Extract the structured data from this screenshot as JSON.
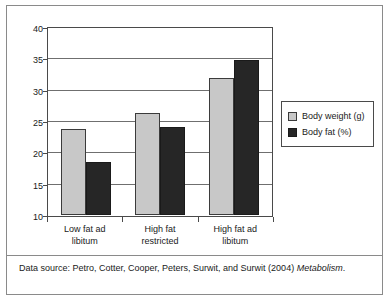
{
  "chart_data": {
    "type": "bar",
    "title": "",
    "subtitle": "",
    "xlabel": "",
    "ylabel": "",
    "categories": [
      "Low fat ad libitum",
      "High fat restricted",
      "High fat ad libitum"
    ],
    "category_lines": [
      [
        "Low fat ad",
        "libitum"
      ],
      [
        "High fat",
        "restricted"
      ],
      [
        "High fat ad",
        "libitum"
      ]
    ],
    "series": [
      {
        "name": "Body weight (g)",
        "values": [
          23.8,
          26.3,
          31.9
        ],
        "color": "#c8c8c8"
      },
      {
        "name": "Body fat (%)",
        "values": [
          18.5,
          24.1,
          34.8
        ],
        "color": "#262626"
      }
    ],
    "ylim": [
      10,
      40
    ],
    "yticks": [
      10,
      15,
      20,
      25,
      30,
      35,
      40
    ],
    "ytick_labels": [
      "10",
      "15",
      "20",
      "25",
      "30",
      "35",
      "40"
    ],
    "grid": true,
    "grid_axis": "y",
    "legend_position": "right"
  },
  "legend": {
    "items": [
      {
        "label": "Body weight (g)",
        "color": "#c8c8c8"
      },
      {
        "label": "Body fat (%)",
        "color": "#262626"
      }
    ]
  },
  "caption": {
    "prefix": "Data source: Petro, Cotter, Cooper, Peters, Surwit, and Surwit (2004) ",
    "italic": "Metabolism",
    "suffix": "."
  }
}
